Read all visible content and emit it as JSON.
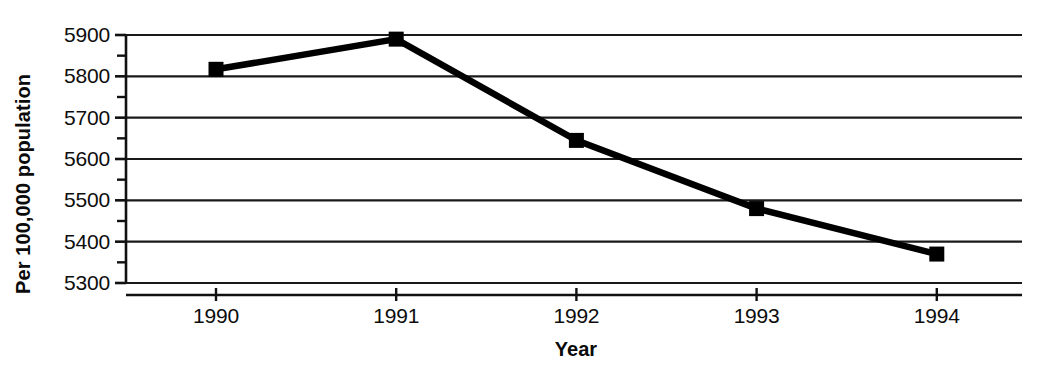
{
  "chart_data": {
    "type": "line",
    "title": "",
    "xlabel": "Year",
    "ylabel": "Per 100,000 population",
    "categories": [
      "1990",
      "1991",
      "1992",
      "1993",
      "1994"
    ],
    "x": [
      1990,
      1991,
      1992,
      1993,
      1994
    ],
    "values": [
      5817,
      5890,
      5645,
      5480,
      5370
    ],
    "series": [
      {
        "name": "Rate per 100,000 population",
        "values": [
          5817,
          5890,
          5645,
          5480,
          5370
        ]
      }
    ],
    "xlim": [
      1989.5,
      1994.46
    ],
    "ylim": [
      5300,
      5900
    ],
    "ytick_labels": [
      "5900",
      "5800",
      "5700",
      "5600",
      "5500",
      "5400",
      "5300"
    ],
    "ytick_values": [
      5900,
      5800,
      5700,
      5600,
      5500,
      5400,
      5300
    ],
    "yminor_values": [
      5850,
      5750,
      5650,
      5550,
      5450,
      5350
    ],
    "xtick_labels": [
      "1990",
      "1991",
      "1992",
      "1993",
      "1994"
    ],
    "grid": "horizontal-major-only",
    "legend": "none",
    "marker": "square",
    "line_color": "#000000",
    "marker_color": "#000000",
    "grid_color": "#1a1a1a",
    "background_color": "#ffffff"
  },
  "axes": {
    "y_title": "Per 100,000 population",
    "x_title": "Year",
    "y_labels": [
      "5900",
      "5800",
      "5700",
      "5600",
      "5500",
      "5400",
      "5300"
    ],
    "x_labels": [
      "1990",
      "1991",
      "1992",
      "1993",
      "1994"
    ]
  }
}
